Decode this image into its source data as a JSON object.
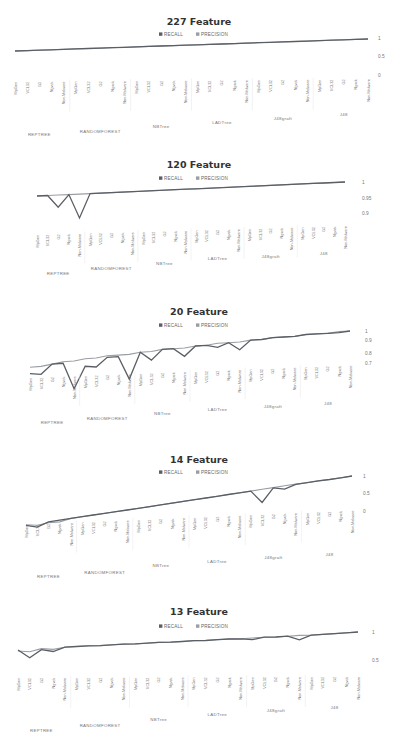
{
  "colors": {
    "recall": "#5a5f66",
    "precision": "#9a9ea3"
  },
  "legend": {
    "recall": "RECALL",
    "precision": "PRECISION"
  },
  "chart_data": [
    {
      "type": "line",
      "title": "227 Feature",
      "yticks": [
        "1",
        "0.5",
        "0"
      ],
      "ylim": [
        0,
        1
      ],
      "groups": [
        "REPTREE",
        "RANDOMFOREST",
        "NBTree",
        "LADTree",
        "J48graft",
        "J48"
      ],
      "categories": [
        "MpGen",
        "VCL32",
        "G2",
        "Ngvck",
        "Non-Malware",
        "MpGen",
        "VCL32",
        "G2",
        "Ngvck",
        "Non-Malware",
        "MpGen",
        "VCL32",
        "G2",
        "Ngvck",
        "Non-Malware",
        "MpGen",
        "VCL32",
        "G2",
        "Ngvck",
        "Non-Malware",
        "MpGen",
        "VCL32",
        "G2",
        "Ngvck",
        "Non-Malware",
        "MpGen",
        "VCL32",
        "G2",
        "Ngvck",
        "Non-Malware"
      ],
      "series": [
        {
          "name": "RECALL",
          "values": [
            1,
            1,
            1,
            1,
            1,
            1,
            1,
            1,
            1,
            1,
            1,
            1,
            1,
            1,
            1,
            1,
            1,
            1,
            1,
            1,
            1,
            1,
            1,
            1,
            1,
            1,
            1,
            1,
            1,
            1
          ]
        },
        {
          "name": "PRECISION",
          "values": [
            1,
            1,
            1,
            1,
            1,
            1,
            1,
            1,
            1,
            1,
            1,
            1,
            1,
            1,
            1,
            1,
            1,
            1,
            1,
            1,
            1,
            1,
            1,
            1,
            1,
            1,
            1,
            1,
            1,
            1
          ]
        }
      ]
    },
    {
      "type": "line",
      "title": "120 Feature",
      "yticks": [
        "1",
        "0.95",
        "0.9"
      ],
      "ylim": [
        0.9,
        1
      ],
      "groups": [
        "REPTREE",
        "RANDOMFOREST",
        "NBTree",
        "LADTree",
        "J48graft",
        "J48"
      ],
      "categories": [
        "MpGen",
        "VCL32",
        "G2",
        "Ngvck",
        "Non-Malware",
        "MpGen",
        "VCL32",
        "G2",
        "Ngvck",
        "Non-Malware",
        "MpGen",
        "VCL32",
        "G2",
        "Ngvck",
        "Non-Malware",
        "MpGen",
        "VCL32",
        "G2",
        "Ngvck",
        "Non-Malware",
        "MpGen",
        "VCL32",
        "G2",
        "Ngvck",
        "Non-Malware",
        "MpGen",
        "VCL32",
        "G2",
        "Ngvck",
        "Non-Malware"
      ],
      "series": [
        {
          "name": "RECALL",
          "values": [
            1,
            1,
            0.97,
            1,
            0.94,
            1,
            1,
            1,
            1,
            1,
            1,
            1,
            1,
            1,
            1,
            1,
            1,
            1,
            1,
            1,
            1,
            1,
            1,
            1,
            1,
            1,
            1,
            1,
            1,
            1
          ]
        },
        {
          "name": "PRECISION",
          "values": [
            1,
            1,
            1,
            1,
            1,
            1,
            1,
            1,
            1,
            1,
            1,
            1,
            1,
            1,
            1,
            1,
            1,
            1,
            1,
            1,
            1,
            1,
            1,
            1,
            1,
            1,
            1,
            1,
            1,
            1
          ]
        }
      ]
    },
    {
      "type": "line",
      "title": "20 Feature",
      "yticks": [
        "1",
        "0.9",
        "0.8",
        "0.7"
      ],
      "ylim": [
        0.7,
        1
      ],
      "groups": [
        "REPTREE",
        "RANDOMFOREST",
        "NBTree",
        "LADTree",
        "J48graft",
        "J48"
      ],
      "categories": [
        "MpGen",
        "VCL32",
        "G2",
        "Ngvck",
        "Non-Malware",
        "MpGen",
        "VCL32",
        "G2",
        "Ngvck",
        "Non-Malware",
        "MpGen",
        "VCL32",
        "G2",
        "Ngvck",
        "Non-Malware",
        "MpGen",
        "VCL32",
        "G2",
        "Ngvck",
        "Non-Malware",
        "MpGen",
        "VCL32",
        "G2",
        "Ngvck",
        "Non-Malware",
        "MpGen",
        "VCL32",
        "G2",
        "Ngvck",
        "Non-Malware"
      ],
      "series": [
        {
          "name": "RECALL",
          "values": [
            0.84,
            0.83,
            0.89,
            0.89,
            0.72,
            0.86,
            0.85,
            0.91,
            0.91,
            0.75,
            0.93,
            0.87,
            0.94,
            0.94,
            0.88,
            0.95,
            0.95,
            0.93,
            0.96,
            0.9,
            0.97,
            0.97,
            0.98,
            0.98,
            0.98,
            0.99,
            0.99,
            0.99,
            0.99,
            1
          ]
        },
        {
          "name": "PRECISION",
          "values": [
            0.88,
            0.88,
            0.89,
            0.9,
            0.9,
            0.91,
            0.91,
            0.92,
            0.92,
            0.92,
            0.93,
            0.93,
            0.94,
            0.94,
            0.94,
            0.95,
            0.95,
            0.96,
            0.96,
            0.96,
            0.97,
            0.97,
            0.98,
            0.98,
            0.98,
            0.99,
            0.99,
            0.99,
            1,
            1
          ]
        }
      ]
    },
    {
      "type": "line",
      "title": "14 Feature",
      "yticks": [
        "1",
        "0.5",
        "0"
      ],
      "ylim": [
        0,
        1
      ],
      "groups": [
        "REPTREE",
        "RANDOMFOREST",
        "NBTree",
        "LADTree",
        "J48graft",
        "J48"
      ],
      "categories": [
        "MpGen",
        "VCL32",
        "G2",
        "Ngvck",
        "Non-Malware",
        "MpGen",
        "VCL32",
        "G2",
        "Ngvck",
        "Non-Malware",
        "MpGen",
        "VCL32",
        "G2",
        "Ngvck",
        "Non-Malware",
        "MpGen",
        "VCL32",
        "G2",
        "Ngvck",
        "Non-Malware",
        "MpGen",
        "VCL32",
        "G2",
        "Ngvck",
        "Non-Malware",
        "MpGen",
        "VCL32",
        "G2",
        "Ngvck",
        "Non-Malware"
      ],
      "series": [
        {
          "name": "RECALL",
          "values": [
            0.72,
            0.62,
            0.75,
            0.76,
            0.77,
            0.78,
            0.79,
            0.8,
            0.81,
            0.82,
            0.83,
            0.84,
            0.85,
            0.86,
            0.87,
            0.88,
            0.89,
            0.9,
            0.91,
            0.92,
            0.93,
            0.55,
            0.94,
            0.86,
            0.96,
            0.97,
            0.98,
            0.98,
            0.99,
            1
          ]
        },
        {
          "name": "PRECISION",
          "values": [
            0.74,
            0.68,
            0.72,
            0.7,
            0.77,
            0.78,
            0.79,
            0.8,
            0.81,
            0.82,
            0.83,
            0.84,
            0.85,
            0.86,
            0.87,
            0.88,
            0.89,
            0.9,
            0.91,
            0.92,
            0.93,
            0.94,
            0.95,
            0.96,
            0.97,
            0.97,
            0.98,
            0.98,
            0.99,
            1
          ]
        }
      ]
    },
    {
      "type": "line",
      "title": "13 Feature",
      "yticks": [
        "1",
        "0.5"
      ],
      "ylim": [
        0.4,
        1
      ],
      "groups": [
        "REPTREE",
        "RANDOMFOREST",
        "NBTree",
        "LADTree",
        "J48graft",
        "J48"
      ],
      "categories": [
        "MpGen",
        "VCL32",
        "G2",
        "Ngvck",
        "Non-Malware",
        "MpGen",
        "VCL32",
        "G2",
        "Ngvck",
        "Non-Malware",
        "MpGen",
        "VCL32",
        "G2",
        "Ngvck",
        "Non-Malware",
        "MpGen",
        "VCL32",
        "G2",
        "Ngvck",
        "Non-Malware",
        "MpGen",
        "VCL32",
        "G2",
        "Ngvck",
        "Non-Malware",
        "MpGen",
        "VCL32",
        "G2",
        "Ngvck",
        "Non-Malware"
      ],
      "series": [
        {
          "name": "RECALL",
          "values": [
            0.78,
            0.62,
            0.78,
            0.74,
            0.82,
            0.83,
            0.84,
            0.84,
            0.85,
            0.86,
            0.86,
            0.87,
            0.88,
            0.88,
            0.89,
            0.9,
            0.9,
            0.91,
            0.92,
            0.92,
            0.9,
            0.94,
            0.94,
            0.95,
            0.88,
            0.96,
            0.97,
            0.98,
            0.99,
            1
          ]
        },
        {
          "name": "PRECISION",
          "values": [
            0.76,
            0.74,
            0.8,
            0.78,
            0.82,
            0.83,
            0.84,
            0.84,
            0.85,
            0.86,
            0.86,
            0.87,
            0.88,
            0.88,
            0.89,
            0.9,
            0.9,
            0.91,
            0.92,
            0.92,
            0.93,
            0.94,
            0.94,
            0.95,
            0.96,
            0.96,
            0.97,
            0.98,
            0.99,
            1
          ]
        }
      ]
    }
  ]
}
